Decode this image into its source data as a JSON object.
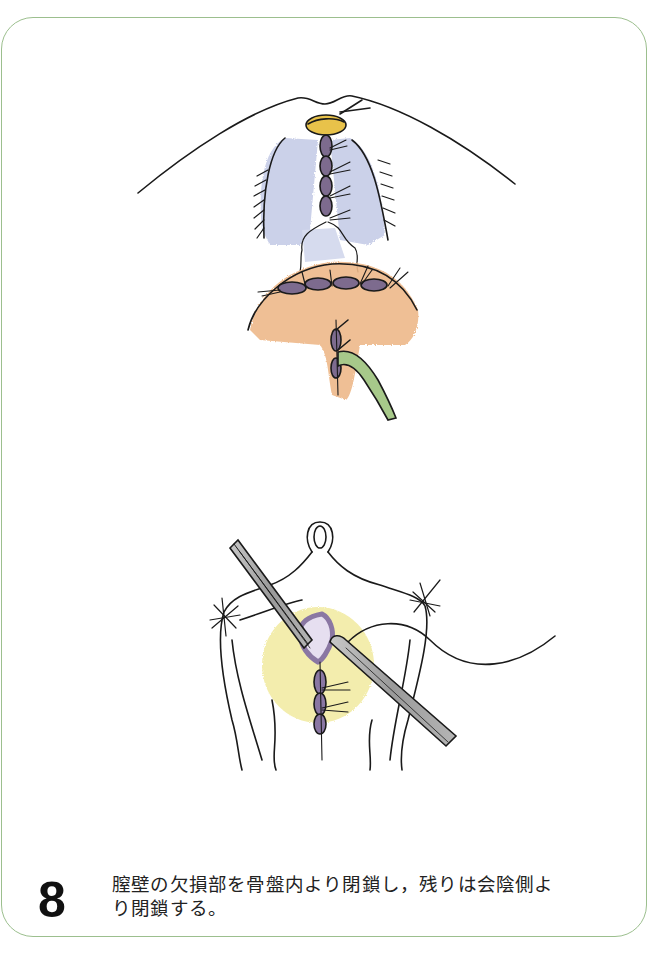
{
  "figure": {
    "step_number": "8",
    "caption_lines": [
      "膣壁の欠損部を骨盤内より閉鎖し，残りは会陰側よ",
      "り閉鎖する。"
    ],
    "frame_color": "#9cbf8e"
  },
  "illustrations": [
    {
      "id": "upper",
      "subject": "vaginal-wall-closure-pelvic-side",
      "colors": {
        "yellow_tissue": "#e8c24a",
        "blue_tissue": "#b9c0df",
        "orange_tissue": "#eeb98a",
        "suture_purple": "#7d6b8e",
        "drain_green": "#a7c98a"
      }
    },
    {
      "id": "lower",
      "subject": "perineal-side-closure-with-forceps",
      "colors": {
        "yellow_tissue": "#f1ea9f",
        "suture_purple": "#8a77a3",
        "instrument_gray": "#9a9a9a"
      }
    }
  ]
}
